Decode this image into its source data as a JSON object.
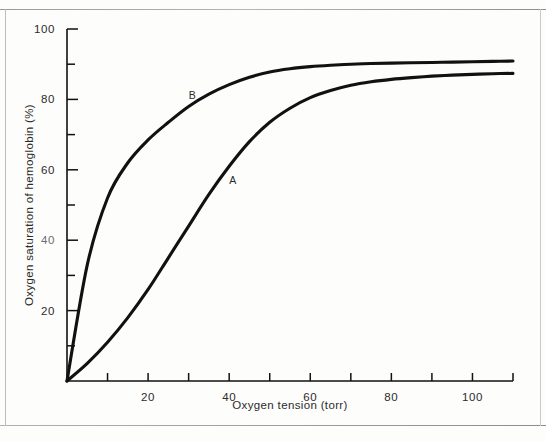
{
  "chart_data": {
    "type": "line",
    "title": "",
    "xlabel": "Oxygen tension (torr)",
    "ylabel": "Oxygen saturation of hemoglobin (%)",
    "xlim": [
      0,
      110
    ],
    "ylim": [
      0,
      100
    ],
    "grid": false,
    "legend": "inline-curve-labels",
    "x_ticks_major": [
      20,
      40,
      60,
      80,
      100
    ],
    "x_ticks_all": [
      0,
      10,
      20,
      30,
      40,
      50,
      60,
      70,
      80,
      90,
      100,
      110
    ],
    "x_tick_labels": [
      "20",
      "40",
      "60",
      "80",
      "100"
    ],
    "y_ticks_major": [
      20,
      40,
      60,
      80,
      100
    ],
    "y_ticks_all": [
      0,
      10,
      20,
      30,
      40,
      50,
      60,
      70,
      80,
      90,
      100
    ],
    "y_tick_labels": [
      "20",
      "40",
      "60",
      "80",
      "100"
    ],
    "y_tick_label_40_note": "printed faintly / partially dropped out in scan",
    "series": [
      {
        "name": "A",
        "label": "A",
        "label_x": 40,
        "label_y": 56,
        "color": "#111111",
        "x": [
          0,
          5,
          10,
          15,
          20,
          25,
          30,
          35,
          40,
          45,
          50,
          55,
          60,
          65,
          70,
          75,
          80,
          85,
          90,
          95,
          100,
          105,
          110
        ],
        "y": [
          0,
          5,
          11,
          18,
          26,
          35,
          44,
          53,
          61,
          68,
          73.5,
          77.5,
          80.5,
          82.5,
          84,
          85,
          85.7,
          86.2,
          86.6,
          86.9,
          87.1,
          87.3,
          87.4
        ]
      },
      {
        "name": "B",
        "label": "B",
        "label_x": 30,
        "label_y": 80,
        "color": "#111111",
        "x": [
          0,
          5,
          10,
          15,
          20,
          25,
          30,
          35,
          40,
          45,
          50,
          55,
          60,
          65,
          70,
          75,
          80,
          85,
          90,
          95,
          100,
          105,
          110
        ],
        "y": [
          0,
          33,
          52,
          62,
          68.5,
          73.5,
          78,
          81.5,
          84.2,
          86.3,
          87.8,
          88.7,
          89.3,
          89.7,
          90,
          90.2,
          90.3,
          90.4,
          90.5,
          90.6,
          90.7,
          90.8,
          90.9
        ]
      }
    ]
  },
  "figure": {
    "background_color": "#fdfdfc",
    "line_color": "#111111",
    "border_color": "#a8a8a8"
  }
}
